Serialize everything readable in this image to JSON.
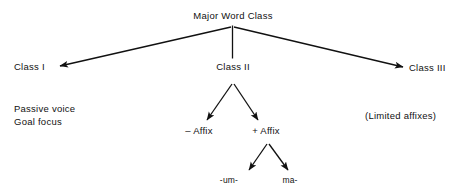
{
  "diagram": {
    "type": "tree",
    "title": "Major Word Class",
    "root": {
      "label": "Major Word Class"
    },
    "level1": {
      "class_one": "Class I",
      "class_two": "Class II",
      "class_three": "Class III"
    },
    "level2": {
      "minus_affix": "– Affix",
      "plus_affix": "+ Affix"
    },
    "level3": {
      "infix_um": "-um-",
      "prefix_ma": "ma-"
    },
    "annotations": {
      "left_line1": "Passive voice",
      "left_line2": "Goal focus",
      "right_note": "(Limited affixes)"
    },
    "colors": {
      "background": "#ffffff",
      "ink": "#111111",
      "edge": "#111111"
    }
  }
}
